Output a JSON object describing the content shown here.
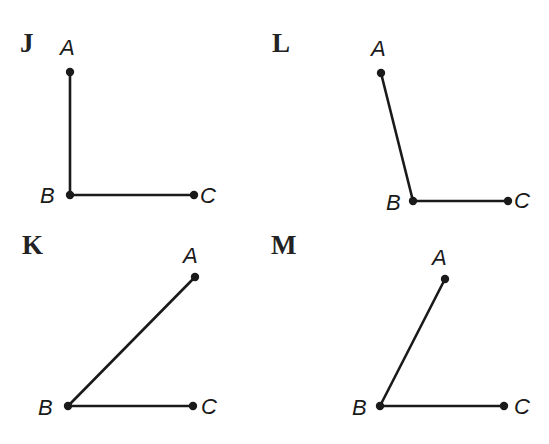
{
  "figure": {
    "top_text_cutoff": true
  },
  "colors": {
    "ink": "#1a1a1a",
    "background": "#ffffff"
  },
  "panels": [
    {
      "id": "J",
      "label": "J",
      "label_pos": [
        20,
        30
      ],
      "angle_type": "right",
      "points": {
        "A": {
          "label": "A",
          "x": 70,
          "y": 72,
          "label_x": 60,
          "label_y": 37
        },
        "B": {
          "label": "B",
          "x": 70,
          "y": 195,
          "label_x": 40,
          "label_y": 185
        },
        "C": {
          "label": "C",
          "x": 194,
          "y": 195,
          "label_x": 200,
          "label_y": 185
        }
      }
    },
    {
      "id": "L",
      "label": "L",
      "label_pos": [
        272,
        30
      ],
      "angle_type": "obtuse",
      "points": {
        "A": {
          "label": "A",
          "x": 381,
          "y": 73,
          "label_x": 371,
          "label_y": 38
        },
        "B": {
          "label": "B",
          "x": 413,
          "y": 201,
          "label_x": 386,
          "label_y": 192
        },
        "C": {
          "label": "C",
          "x": 508,
          "y": 201,
          "label_x": 514,
          "label_y": 190
        }
      }
    },
    {
      "id": "K",
      "label": "K",
      "label_pos": [
        22,
        232
      ],
      "angle_type": "acute",
      "points": {
        "A": {
          "label": "A",
          "x": 195,
          "y": 277,
          "label_x": 183,
          "label_y": 245
        },
        "B": {
          "label": "B",
          "x": 68,
          "y": 406,
          "label_x": 38,
          "label_y": 397
        },
        "C": {
          "label": "C",
          "x": 193,
          "y": 406,
          "label_x": 201,
          "label_y": 396
        }
      }
    },
    {
      "id": "M",
      "label": "M",
      "label_pos": [
        271,
        232
      ],
      "angle_type": "acute",
      "points": {
        "A": {
          "label": "A",
          "x": 445,
          "y": 279,
          "label_x": 432,
          "label_y": 247
        },
        "B": {
          "label": "B",
          "x": 380,
          "y": 406,
          "label_x": 352,
          "label_y": 397
        },
        "C": {
          "label": "C",
          "x": 504,
          "y": 406,
          "label_x": 514,
          "label_y": 396
        }
      }
    }
  ]
}
